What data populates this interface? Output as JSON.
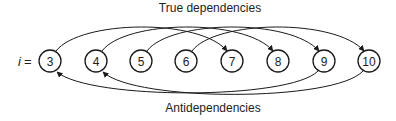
{
  "diagram": {
    "title_top": "True dependencies",
    "title_bottom": "Antidependencies",
    "index_label": "i",
    "index_eq": "=",
    "nodes": [
      {
        "label": "3",
        "cx": 50
      },
      {
        "label": "4",
        "cx": 96
      },
      {
        "label": "5",
        "cx": 141
      },
      {
        "label": "6",
        "cx": 186
      },
      {
        "label": "7",
        "cx": 232
      },
      {
        "label": "8",
        "cx": 278
      },
      {
        "label": "9",
        "cx": 324
      },
      {
        "label": "10",
        "cx": 369
      }
    ],
    "true_dependencies": [
      {
        "from": "3",
        "to": "7"
      },
      {
        "from": "4",
        "to": "8"
      },
      {
        "from": "5",
        "to": "9"
      },
      {
        "from": "6",
        "to": "10"
      }
    ],
    "antidependencies": [
      {
        "from": "9",
        "to": "3"
      },
      {
        "from": "10",
        "to": "4"
      }
    ],
    "colors": {
      "stroke": "#1a1a1a",
      "text": "#222222",
      "background": "#ffffff"
    }
  }
}
